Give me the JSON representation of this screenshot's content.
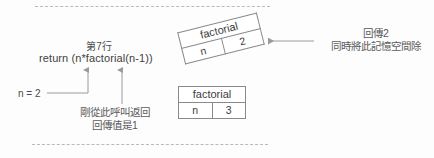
{
  "diagram": {
    "title_context": "recursion call stack illustration",
    "code": {
      "line_label": "第7行",
      "statement": "return (n*factorial(n-1))"
    },
    "variable": {
      "label": "n = 2"
    },
    "notes": {
      "bottom": {
        "line1": "剛從此呼叫返回",
        "line2": "回傳值是1"
      },
      "right": {
        "line1": "回傳2",
        "line2": "同時將此記憶空間除"
      }
    },
    "frames": [
      {
        "id": "frame-top-tilted",
        "header": "factorial",
        "var_name": "n",
        "var_value": "2",
        "rotated": true
      },
      {
        "id": "frame-bottom",
        "header": "factorial",
        "var_name": "n",
        "var_value": "3",
        "rotated": false
      }
    ],
    "colors": {
      "background": "#fdfdfd",
      "text": "#4b4b4b",
      "border": "#8a8a8a",
      "dashed": "#b9b9b9",
      "arrow": "#9a9a9a"
    }
  }
}
